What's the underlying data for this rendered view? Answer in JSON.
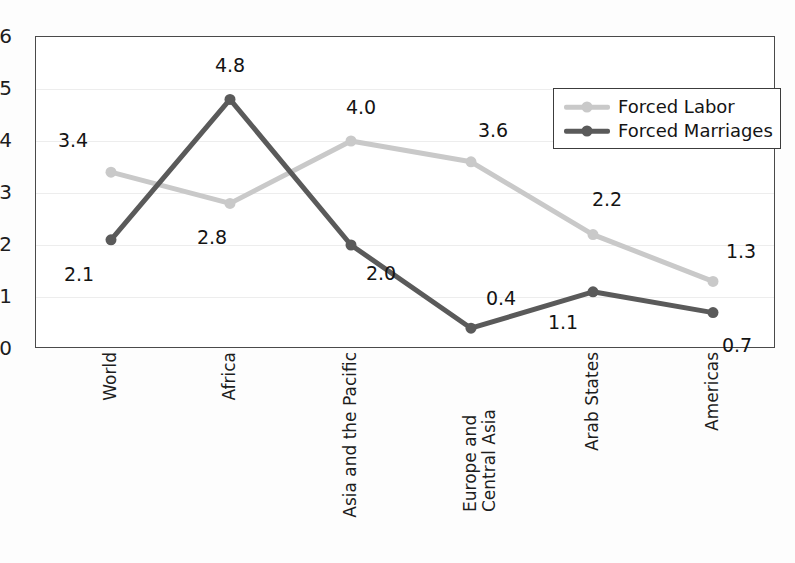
{
  "chart_data": {
    "type": "line",
    "title": "",
    "subtitle": "",
    "xlabel": "",
    "ylabel": "",
    "ylim": [
      0,
      6
    ],
    "yticks": [
      "0",
      "1",
      "2",
      "3",
      "4",
      "5",
      "6"
    ],
    "grid": true,
    "legend_position": "top-right",
    "categories": [
      "World",
      "Africa",
      "Asia and the Pacific",
      "Europe and Central Asia",
      "Arab States",
      "Americas"
    ],
    "series": [
      {
        "name": "Forced Labor",
        "color": "#c9c9c9",
        "values": [
          3.4,
          2.8,
          4.0,
          3.6,
          2.2,
          1.3
        ],
        "labels": [
          "3.4",
          "2.8",
          "4.0",
          "3.6",
          "2.2",
          "1.3"
        ]
      },
      {
        "name": "Forced Marriages",
        "color": "#5a5a5a",
        "values": [
          2.1,
          4.8,
          2.0,
          0.4,
          1.1,
          0.7
        ],
        "labels": [
          "2.1",
          "4.8",
          "2.0",
          "0.4",
          "1.1",
          "0.7"
        ]
      }
    ]
  },
  "legend": {
    "items": [
      {
        "label": "Forced Labor",
        "color": "#c9c9c9"
      },
      {
        "label": "Forced Marriages",
        "color": "#5a5a5a"
      }
    ]
  },
  "axis": {
    "y_tick_labels": [
      "6",
      "5",
      "4",
      "3",
      "2",
      "1",
      "0"
    ]
  }
}
